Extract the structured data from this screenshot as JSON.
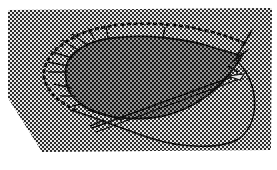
{
  "diagram": {
    "colors": {
      "background": "#ffffff",
      "field_dot": "#2a2a2a",
      "field_light": "#e6e6e6",
      "blob_dark": "#1a1a1a",
      "blob_light": "#9a9a9a",
      "line": "#111111"
    },
    "shapes": [
      {
        "id": "halftone-field",
        "type": "polygon",
        "points": [
          [
            8,
            10
          ],
          [
            272,
            8
          ],
          [
            271,
            150
          ],
          [
            42,
            152
          ],
          [
            8,
            98
          ]
        ]
      },
      {
        "id": "dark-oval-region",
        "type": "blob"
      },
      {
        "id": "dotted-boundary",
        "type": "dotted-arc"
      },
      {
        "id": "radial-ticks",
        "type": "tick-lines",
        "count": 11
      },
      {
        "id": "loop-curve",
        "type": "curve"
      },
      {
        "id": "diagonal-double-line",
        "type": "double-line"
      }
    ]
  }
}
